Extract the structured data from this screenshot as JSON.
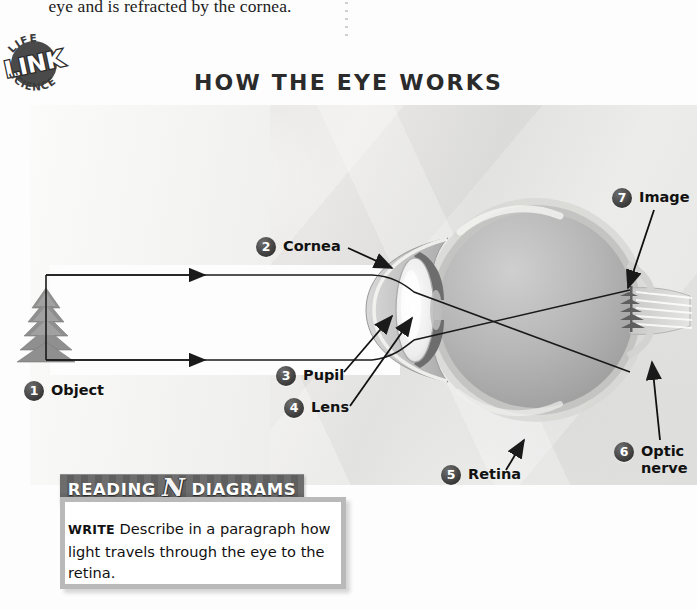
{
  "running_text": "eye and is refracted by the cornea.",
  "badge": {
    "top_text": "LIFE",
    "center_text": "LINK",
    "bottom_text": "SCIENCE"
  },
  "diagram": {
    "title": "HOW THE EYE WORKS",
    "labels": [
      {
        "number": "1",
        "text": "Object"
      },
      {
        "number": "2",
        "text": "Cornea"
      },
      {
        "number": "3",
        "text": "Pupil"
      },
      {
        "number": "4",
        "text": "Lens"
      },
      {
        "number": "5",
        "text": "Retina"
      },
      {
        "number": "6",
        "text": "Optic\nnerve"
      },
      {
        "number": "7",
        "text": "Image"
      }
    ]
  },
  "reading_banner": {
    "left_word": "READING",
    "middle_glyph": "N",
    "right_word": "DIAGRAMS"
  },
  "write_activity": {
    "keyword": "WRITE",
    "prompt": "Describe in a paragraph how light travels through the eye to the retina."
  },
  "colors": {
    "badge_fill": "#4a4a4a",
    "label_badge": "#3a3a3a",
    "banner_bg": "#666666",
    "write_border": "#b9b9b9",
    "title_color": "#2b2b2b"
  }
}
